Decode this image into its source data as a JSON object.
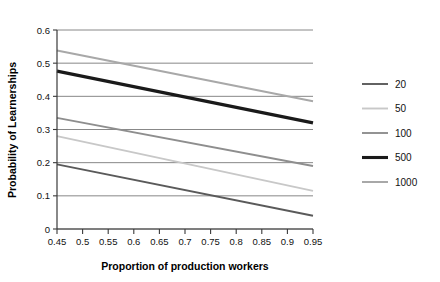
{
  "chart_data": {
    "type": "line",
    "title": "",
    "xlabel": "Proportion of production workers",
    "ylabel": "Probability of Learnerships",
    "xlim": [
      0.45,
      0.95
    ],
    "ylim": [
      0,
      0.6
    ],
    "xticks": [
      "0.45",
      "0.5",
      "0.55",
      "0.6",
      "0.65",
      "0.7",
      "0.75",
      "0.8",
      "0.85",
      "0.9",
      "0.95"
    ],
    "xtick_values": [
      0.45,
      0.5,
      0.55,
      0.6,
      0.65,
      0.7,
      0.75,
      0.8,
      0.85,
      0.9,
      0.95
    ],
    "yticks": [
      "0",
      "0.1",
      "0.2",
      "0.3",
      "0.4",
      "0.5",
      "0.6"
    ],
    "ytick_values": [
      0,
      0.1,
      0.2,
      0.3,
      0.4,
      0.5,
      0.6
    ],
    "grid": "horizontal",
    "legend_position": "right",
    "x": [
      0.45,
      0.95
    ],
    "series": [
      {
        "name": "20",
        "values": [
          0.195,
          0.04
        ],
        "color": "#5a5a5a",
        "width": 1.9
      },
      {
        "name": "50",
        "values": [
          0.28,
          0.115
        ],
        "color": "#c8c8c8",
        "width": 1.9
      },
      {
        "name": "100",
        "values": [
          0.335,
          0.19
        ],
        "color": "#8e8e8e",
        "width": 1.9
      },
      {
        "name": "500",
        "values": [
          0.476,
          0.32
        ],
        "color": "#1a1a1a",
        "width": 3.1
      },
      {
        "name": "1000",
        "values": [
          0.538,
          0.385
        ],
        "color": "#a8a8a8",
        "width": 2.0
      }
    ],
    "legend_order": [
      "20",
      "50",
      "100",
      "500",
      "1000"
    ]
  },
  "axes": {
    "axis_color": "#3a3a3a",
    "grid_color": "#7a7a7a",
    "background": "#ffffff"
  }
}
